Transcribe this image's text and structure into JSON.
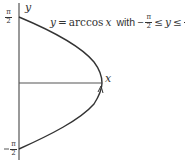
{
  "title": {
    "lhs": "y",
    "eq": " = ",
    "func": "arccos",
    "arg": "x",
    "with": "with",
    "minus": "−",
    "frac_num": "π",
    "frac_den": "2",
    "le1": "≤",
    "var": "y",
    "le2": "≤"
  },
  "axes": {
    "x_label": "x",
    "y_label": "y"
  },
  "ticks": {
    "top": {
      "num": "π",
      "den": "2",
      "sign": ""
    },
    "bottom": {
      "num": "π",
      "den": "2",
      "sign": "−"
    }
  },
  "colors": {
    "axis": "#555555",
    "curve": "#333333",
    "text": "#333333"
  }
}
